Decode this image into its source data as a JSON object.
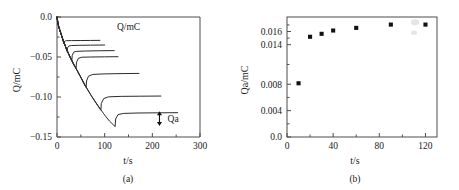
{
  "figure": {
    "caption_a": "(a)",
    "caption_b": "(b)"
  },
  "chart_data": [
    {
      "panel": "a",
      "type": "line",
      "title": "",
      "inner_annotation": "Q/mC",
      "xlabel": "t/s",
      "ylabel": "Q/mC",
      "xlim": [
        0,
        300
      ],
      "ylim": [
        -0.15,
        0.0
      ],
      "xticks": [
        0,
        100,
        200,
        300
      ],
      "xticklabels": [
        "0",
        "100",
        "200",
        "300"
      ],
      "yticks": [
        0.0,
        -0.05,
        -0.1,
        -0.15
      ],
      "yticklabels": [
        "0.0",
        "-0.05",
        "-0.10",
        "-0.15"
      ],
      "xminorticks": [
        50,
        150,
        250
      ],
      "yminorticks": [
        -0.025,
        -0.075,
        -0.125
      ],
      "grid": false,
      "legend": "none",
      "annotations": [
        {
          "text": "Q/mC",
          "x": 150,
          "y": -0.012
        },
        {
          "text": "Qa",
          "x": 232,
          "y": -0.1275,
          "arrow": "double-vertical",
          "arrow_x": 215,
          "arrow_y0": -0.1185,
          "arrow_y1": -0.1355
        }
      ],
      "series": [
        {
          "name": "step-1",
          "switch_time": 14,
          "min_value": -0.0335,
          "plateau_value": -0.0295,
          "plateau_end": 90,
          "points": [
            [
              0,
              0.0
            ],
            [
              1,
              -0.0055
            ],
            [
              2,
              -0.0085
            ],
            [
              3,
              -0.011
            ],
            [
              5,
              -0.015
            ],
            [
              7,
              -0.0185
            ],
            [
              9,
              -0.022
            ],
            [
              11,
              -0.026
            ],
            [
              13,
              -0.0305
            ],
            [
              14,
              -0.0335
            ],
            [
              15,
              -0.031
            ],
            [
              17,
              -0.03
            ],
            [
              20,
              -0.0296
            ],
            [
              30,
              -0.0295
            ],
            [
              50,
              -0.0294
            ],
            [
              70,
              -0.0293
            ],
            [
              90,
              -0.0292
            ]
          ]
        },
        {
          "name": "step-2",
          "switch_time": 21,
          "min_value": -0.043,
          "plateau_value": -0.0355,
          "plateau_end": 100,
          "points": [
            [
              0,
              0.0
            ],
            [
              1,
              -0.0055
            ],
            [
              3,
              -0.011
            ],
            [
              5,
              -0.015
            ],
            [
              8,
              -0.02
            ],
            [
              11,
              -0.026
            ],
            [
              14,
              -0.031
            ],
            [
              17,
              -0.0355
            ],
            [
              19,
              -0.0395
            ],
            [
              21,
              -0.043
            ],
            [
              22,
              -0.0385
            ],
            [
              25,
              -0.0362
            ],
            [
              30,
              -0.0357
            ],
            [
              45,
              -0.0354
            ],
            [
              70,
              -0.0352
            ],
            [
              100,
              -0.035
            ]
          ]
        },
        {
          "name": "step-3",
          "switch_time": 31,
          "min_value": -0.0545,
          "plateau_value": -0.0425,
          "plateau_end": 120,
          "points": [
            [
              0,
              0.0
            ],
            [
              2,
              -0.0085
            ],
            [
              5,
              -0.015
            ],
            [
              9,
              -0.022
            ],
            [
              13,
              -0.03
            ],
            [
              17,
              -0.0355
            ],
            [
              21,
              -0.042
            ],
            [
              25,
              -0.047
            ],
            [
              28,
              -0.051
            ],
            [
              31,
              -0.0545
            ],
            [
              32,
              -0.048
            ],
            [
              35,
              -0.044
            ],
            [
              40,
              -0.043
            ],
            [
              60,
              -0.0425
            ],
            [
              90,
              -0.0422
            ],
            [
              120,
              -0.042
            ]
          ]
        },
        {
          "name": "step-4",
          "switch_time": 40,
          "min_value": -0.064,
          "plateau_value": -0.05,
          "plateau_end": 128,
          "points": [
            [
              0,
              0.0
            ],
            [
              2,
              -0.0085
            ],
            [
              6,
              -0.017
            ],
            [
              11,
              -0.026
            ],
            [
              16,
              -0.034
            ],
            [
              21,
              -0.042
            ],
            [
              26,
              -0.048
            ],
            [
              31,
              -0.0545
            ],
            [
              35,
              -0.059
            ],
            [
              40,
              -0.064
            ],
            [
              41,
              -0.0565
            ],
            [
              45,
              -0.0515
            ],
            [
              52,
              -0.0503
            ],
            [
              70,
              -0.05
            ],
            [
              100,
              -0.0498
            ],
            [
              128,
              -0.0496
            ]
          ]
        },
        {
          "name": "step-5",
          "switch_time": 61,
          "min_value": -0.088,
          "plateau_value": -0.071,
          "plateau_end": 172,
          "points": [
            [
              0,
              0.0
            ],
            [
              3,
              -0.011
            ],
            [
              8,
              -0.02
            ],
            [
              14,
              -0.031
            ],
            [
              21,
              -0.042
            ],
            [
              28,
              -0.051
            ],
            [
              35,
              -0.059
            ],
            [
              43,
              -0.0675
            ],
            [
              51,
              -0.077
            ],
            [
              57,
              -0.084
            ],
            [
              61,
              -0.088
            ],
            [
              62,
              -0.08
            ],
            [
              66,
              -0.074
            ],
            [
              75,
              -0.0718
            ],
            [
              95,
              -0.0712
            ],
            [
              130,
              -0.0708
            ],
            [
              172,
              -0.0705
            ]
          ]
        },
        {
          "name": "step-6",
          "switch_time": 92,
          "min_value": -0.1165,
          "plateau_value": -0.099,
          "plateau_end": 218,
          "points": [
            [
              0,
              0.0
            ],
            [
              4,
              -0.013
            ],
            [
              10,
              -0.024
            ],
            [
              18,
              -0.037
            ],
            [
              27,
              -0.0495
            ],
            [
              37,
              -0.0615
            ],
            [
              48,
              -0.073
            ],
            [
              60,
              -0.0865
            ],
            [
              72,
              -0.0985
            ],
            [
              83,
              -0.1085
            ],
            [
              92,
              -0.1165
            ],
            [
              93,
              -0.108
            ],
            [
              98,
              -0.102
            ],
            [
              108,
              -0.0998
            ],
            [
              135,
              -0.0992
            ],
            [
              175,
              -0.099
            ],
            [
              218,
              -0.0988
            ]
          ]
        },
        {
          "name": "step-7",
          "switch_time": 122,
          "min_value": -0.137,
          "plateau_value": -0.12,
          "plateau_end": 253,
          "points": [
            [
              0,
              0.0
            ],
            [
              4,
              -0.013
            ],
            [
              10,
              -0.024
            ],
            [
              18,
              -0.037
            ],
            [
              27,
              -0.0495
            ],
            [
              37,
              -0.0615
            ],
            [
              48,
              -0.073
            ],
            [
              60,
              -0.0865
            ],
            [
              72,
              -0.0985
            ],
            [
              85,
              -0.11
            ],
            [
              98,
              -0.121
            ],
            [
              110,
              -0.13
            ],
            [
              122,
              -0.137
            ],
            [
              123,
              -0.1275
            ],
            [
              128,
              -0.122
            ],
            [
              140,
              -0.1205
            ],
            [
              170,
              -0.12
            ],
            [
              210,
              -0.1198
            ],
            [
              253,
              -0.1196
            ]
          ]
        }
      ]
    },
    {
      "panel": "b",
      "type": "scatter",
      "title": "",
      "xlabel": "t/s",
      "ylabel": "Qa/mC",
      "xlim": [
        0,
        130
      ],
      "ylim": [
        0.0,
        0.0182
      ],
      "xticks": [
        0,
        40,
        80,
        120
      ],
      "xticklabels": [
        "0",
        "40",
        "80",
        "120"
      ],
      "yticks": [
        0.0,
        0.004,
        0.008,
        0.014,
        0.016
      ],
      "yticklabels": [
        "0.0",
        "0.004",
        "0.008",
        "0.014",
        "0.016"
      ],
      "xminorticks": [
        20,
        60,
        100
      ],
      "yminorticks": [
        0.002,
        0.006,
        0.011,
        0.015,
        0.017
      ],
      "grid": false,
      "legend": "none",
      "marker": "square",
      "x": [
        10,
        20,
        30,
        40,
        60,
        90,
        120
      ],
      "y": [
        0.00815,
        0.0152,
        0.01565,
        0.01615,
        0.01655,
        0.01705,
        0.01705
      ]
    }
  ]
}
